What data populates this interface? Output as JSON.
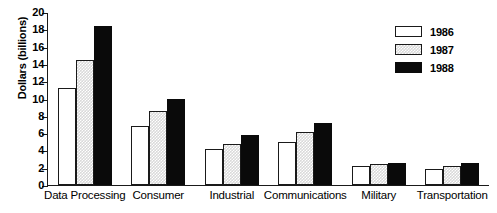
{
  "chart_data": {
    "type": "bar",
    "title": "",
    "xlabel": "",
    "ylabel": "Dollars (billions)",
    "ylim": [
      0,
      20
    ],
    "ytick_step": 2,
    "yticks": [
      0,
      2,
      4,
      6,
      8,
      10,
      12,
      14,
      16,
      18,
      20
    ],
    "grid": false,
    "legend_position": "top-right",
    "categories": [
      "Data Processing",
      "Consumer",
      "Industrial",
      "Communications",
      "Military",
      "Transportation"
    ],
    "series": [
      {
        "name": "1986",
        "fill": "white",
        "color": "#ffffff",
        "values": [
          11.2,
          6.8,
          4.2,
          5.0,
          2.2,
          1.8
        ]
      },
      {
        "name": "1987",
        "fill": "light-gray-hatched",
        "color": "#d9d9d9",
        "values": [
          14.4,
          8.6,
          4.7,
          6.1,
          2.4,
          2.2
        ]
      },
      {
        "name": "1988",
        "fill": "black",
        "color": "#0a0a0a",
        "values": [
          18.4,
          10.0,
          5.8,
          7.2,
          2.5,
          2.5
        ]
      }
    ]
  }
}
